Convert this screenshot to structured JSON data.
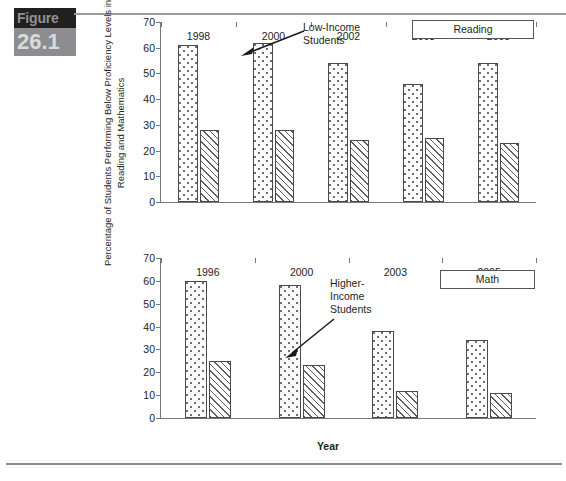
{
  "figure": {
    "word": "Figure",
    "number": "26.1"
  },
  "axis": {
    "y_title": "Percentage of Students Performing Below Proficiency Levels in\nReading and Mathematics",
    "x_title": "Year"
  },
  "annotations": {
    "low_income": "Low-Income\nStudents",
    "higher_income": "Higher-\nIncome\nStudents"
  },
  "caption": "",
  "chart_data": [
    {
      "type": "bar",
      "title": "Reading",
      "xlabel": "Year",
      "ylabel": "Percentage of Students Performing Below Proficiency Levels in Reading and Mathematics",
      "categories": [
        "1998",
        "2000",
        "2002",
        "2003",
        "2005"
      ],
      "yticks": [
        0,
        10,
        20,
        30,
        40,
        50,
        60,
        70
      ],
      "ylim": [
        0,
        70
      ],
      "grid": false,
      "legend": "boxed-label",
      "series": [
        {
          "name": "Low-Income Students",
          "pattern": "dotted",
          "values": [
            61,
            62,
            54,
            46,
            54
          ]
        },
        {
          "name": "Higher-Income Students",
          "pattern": "hatched",
          "values": [
            28,
            28,
            24,
            25,
            23
          ]
        }
      ]
    },
    {
      "type": "bar",
      "title": "Math",
      "xlabel": "Year",
      "ylabel": "Percentage of Students Performing Below Proficiency Levels in Reading and Mathematics",
      "categories": [
        "1996",
        "2000",
        "2003",
        "2005"
      ],
      "yticks": [
        0,
        10,
        20,
        30,
        40,
        50,
        60,
        70
      ],
      "ylim": [
        0,
        70
      ],
      "grid": false,
      "legend": "boxed-label",
      "series": [
        {
          "name": "Low-Income Students",
          "pattern": "dotted",
          "values": [
            60,
            58,
            38,
            34
          ]
        },
        {
          "name": "Higher-Income Students",
          "pattern": "hatched",
          "values": [
            25,
            23,
            12,
            11
          ]
        }
      ]
    }
  ]
}
